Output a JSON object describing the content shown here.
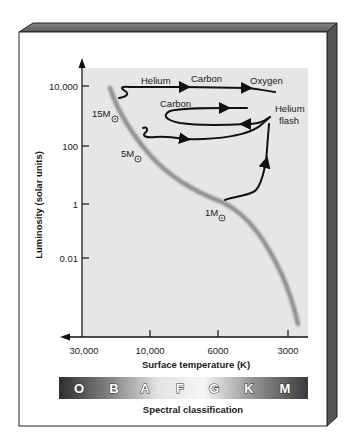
{
  "diagram": {
    "type": "Hertzsprung-Russell evolutionary tracks",
    "y_axis": {
      "title": "Luminosity (solar units)",
      "ticks": [
        "10,000",
        "100",
        "1",
        "0.01"
      ]
    },
    "x_axis": {
      "title": "Surface temperature (K)",
      "ticks": [
        "30,000",
        "10,000",
        "6000",
        "3000"
      ]
    },
    "mass_labels": {
      "m15": "15M",
      "m5": "5M",
      "m1": "1M"
    },
    "sun_symbol": "⊙",
    "track_labels": {
      "helium": "Helium",
      "carbon_top": "Carbon",
      "oxygen": "Oxygen",
      "carbon_mid": "Carbon",
      "helium_flash_1": "Helium",
      "helium_flash_2": "flash"
    },
    "spectral": {
      "title": "Spectral classification",
      "classes": [
        "O",
        "B",
        "A",
        "F",
        "G",
        "K",
        "M"
      ]
    },
    "colors": {
      "plot_bg": "#e6e6e6",
      "main_sequence": "#8f8f8f",
      "tracks": "#111111",
      "bevel_top": "#6e6e6e",
      "bevel_side": "#555555"
    }
  }
}
